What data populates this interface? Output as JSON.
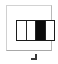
{
  "screen": {
    "width": 58,
    "height": 64,
    "background_color": "#ffffff"
  },
  "panel": {
    "name": "Panel layout button",
    "border_color": "#c8c8c8",
    "background_color": "#ffffff"
  },
  "columns_icon": {
    "label": "Column layout",
    "border_color": "#1c1c1c",
    "divider_color": "#242424",
    "empty_color": "#ffffff",
    "filled_color": "#0b0b0b",
    "selected_index": 2,
    "cells": [
      {
        "name": "column-1",
        "state": "empty"
      },
      {
        "name": "column-2",
        "state": "empty"
      },
      {
        "name": "column-3",
        "state": "filled"
      },
      {
        "name": "column-4",
        "state": "empty"
      }
    ]
  },
  "resize_handle": {
    "label": "Resize handle",
    "color": "#3a3a3a"
  }
}
